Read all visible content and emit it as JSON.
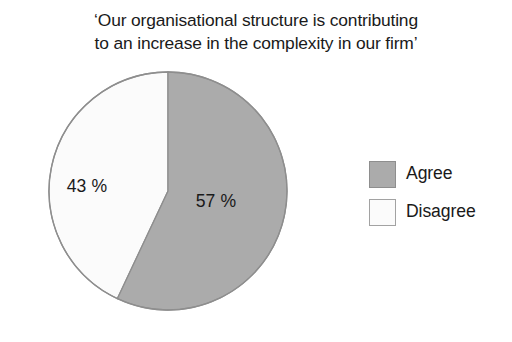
{
  "chart_data": {
    "type": "pie",
    "title": "‘Our organisational structure is contributing\nto an increase in the complexity in our firm’",
    "xlabel": "",
    "ylabel": "",
    "categories": [
      "Agree",
      "Disagree"
    ],
    "values": [
      57,
      43
    ],
    "value_labels": [
      "57 %",
      "43 %"
    ],
    "units": "percent",
    "total": 100,
    "start_angle_deg": 0,
    "direction": "clockwise",
    "grid": false,
    "legend_position": "right",
    "slices": [
      {
        "name": "Agree",
        "value": 57,
        "label": "57 %",
        "color": "#ababab",
        "stroke": "#8e8e8e",
        "start_deg": 0,
        "sweep_deg": 205.2
      },
      {
        "name": "Disagree",
        "value": 43,
        "label": "43 %",
        "color": "#fbfbfb",
        "stroke": "#8e8e8e",
        "start_deg": 205.2,
        "sweep_deg": 154.8
      }
    ]
  },
  "legend": {
    "items": [
      {
        "label": "Agree",
        "swatch": "agree-swatch"
      },
      {
        "label": "Disagree",
        "swatch": "disagree-swatch"
      }
    ]
  },
  "colors": {
    "agree_fill": "#ababab",
    "disagree_fill": "#fbfbfb",
    "outline": "#8e8e8e",
    "text": "#1a1a1a",
    "background": "#ffffff"
  }
}
